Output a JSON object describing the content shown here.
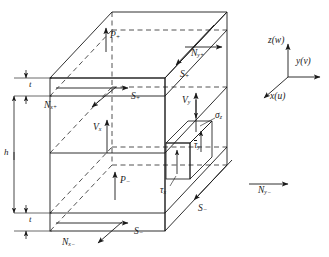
{
  "figure": {
    "type": "3d-stress-resultant-diagram",
    "line_color": "#1a1a1a",
    "background": "#ffffff"
  },
  "axes": {
    "z_label": "z",
    "z_paren": "(w)",
    "y_label": "y",
    "y_paren": "(v)",
    "x_label": "x",
    "x_paren": "(u)"
  },
  "dimensions": {
    "top_thickness": "t",
    "core_height": "h",
    "bottom_thickness": "t"
  },
  "labels": {
    "p_plus": {
      "base": "P",
      "sub": "+"
    },
    "p_minus": {
      "base": "P",
      "sub": "−"
    },
    "n_y_plus": {
      "base": "N",
      "sub": "y+"
    },
    "n_y_minus": {
      "base": "N",
      "sub": "y−"
    },
    "n_x_plus": {
      "base": "N",
      "sub": "x+"
    },
    "n_x_minus": {
      "base": "N",
      "sub": "x−"
    },
    "s_plus_top": {
      "base": "S",
      "sub": "+"
    },
    "s_plus_right": {
      "base": "S",
      "sub": "+"
    },
    "s_minus_bottom": {
      "base": "S",
      "sub": "−"
    },
    "s_minus_right": {
      "base": "S",
      "sub": "−"
    },
    "v_x": {
      "base": "V",
      "sub": "x"
    },
    "v_y": {
      "base": "V",
      "sub": "y"
    },
    "sigma_z": {
      "base": "σ",
      "sub": "z"
    },
    "tau_y_bar": {
      "base": "τ",
      "sub": "y",
      "overbar": true
    },
    "tau_x": {
      "base": "τ",
      "sub": "x"
    }
  }
}
